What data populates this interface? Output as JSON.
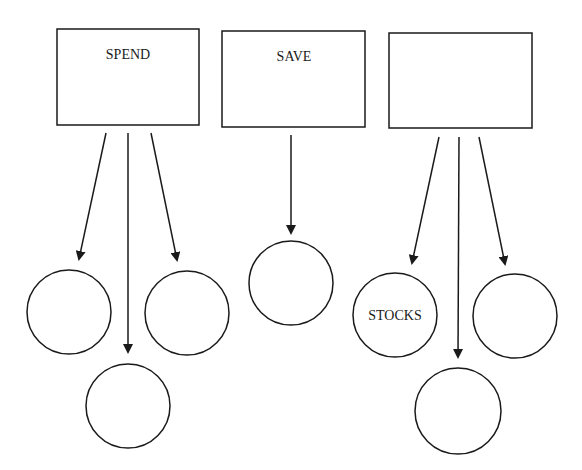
{
  "diagram": {
    "boxes": [
      {
        "id": "spend",
        "label": "SPEND",
        "x": 57,
        "y": 29,
        "w": 142,
        "h": 96
      },
      {
        "id": "save",
        "label": "SAVE",
        "x": 222,
        "y": 31,
        "w": 143,
        "h": 96
      },
      {
        "id": "third",
        "label": "",
        "x": 389,
        "y": 33,
        "w": 143,
        "h": 95
      }
    ],
    "circles": [
      {
        "id": "spend-left",
        "label": "",
        "cx": 69,
        "cy": 312,
        "r": 42
      },
      {
        "id": "spend-bottom",
        "label": "",
        "cx": 128,
        "cy": 406,
        "r": 42
      },
      {
        "id": "spend-right",
        "label": "",
        "cx": 187,
        "cy": 313,
        "r": 42
      },
      {
        "id": "save-circle",
        "label": "",
        "cx": 291,
        "cy": 283,
        "r": 42
      },
      {
        "id": "third-left",
        "label": "STOCKS",
        "cx": 395,
        "cy": 315,
        "r": 42
      },
      {
        "id": "third-bottom",
        "label": "",
        "cx": 458,
        "cy": 411,
        "r": 43
      },
      {
        "id": "third-right",
        "label": "",
        "cx": 515,
        "cy": 316,
        "r": 42
      }
    ],
    "arrows": [
      {
        "from": "spend",
        "to": "spend-left",
        "x1": 106,
        "y1": 133,
        "x2": 79,
        "y2": 259
      },
      {
        "from": "spend",
        "to": "spend-bottom",
        "x1": 128,
        "y1": 133,
        "x2": 128,
        "y2": 352
      },
      {
        "from": "spend",
        "to": "spend-right",
        "x1": 151,
        "y1": 133,
        "x2": 177,
        "y2": 260
      },
      {
        "from": "save",
        "to": "save-circle",
        "x1": 291,
        "y1": 135,
        "x2": 291,
        "y2": 233
      },
      {
        "from": "third",
        "to": "third-left",
        "x1": 439,
        "y1": 137,
        "x2": 412,
        "y2": 263
      },
      {
        "from": "third",
        "to": "third-bottom",
        "x1": 459,
        "y1": 137,
        "x2": 458,
        "y2": 357
      },
      {
        "from": "third",
        "to": "third-right",
        "x1": 479,
        "y1": 137,
        "x2": 505,
        "y2": 264
      }
    ],
    "stroke_color": "#1a1a1a"
  }
}
